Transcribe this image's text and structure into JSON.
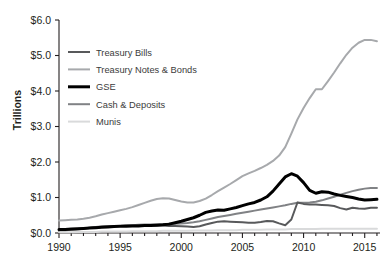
{
  "chart_data": {
    "type": "line",
    "title": "",
    "xlabel": "",
    "ylabel": "Trillions",
    "xlim": [
      1990,
      2016.25
    ],
    "ylim": [
      0.0,
      6.0
    ],
    "grid": false,
    "legend_position": "upper-left",
    "y_ticks": [
      0.0,
      1.0,
      2.0,
      3.0,
      4.0,
      5.0,
      6.0
    ],
    "y_tick_labels": [
      "$0.0",
      "$1.0",
      "$2.0",
      "$3.0",
      "$4.0",
      "$5.0",
      "$6.0"
    ],
    "x_ticks": [
      1990,
      1995,
      2000,
      2005,
      2010,
      2015
    ],
    "x_tick_labels": [
      "1990",
      "1995",
      "2000",
      "2005",
      "2010",
      "2015"
    ],
    "x_minor_tick_interval": 1,
    "x": [
      1990,
      1990.5,
      1991,
      1991.5,
      1992,
      1992.5,
      1993,
      1993.5,
      1994,
      1994.5,
      1995,
      1995.5,
      1996,
      1996.5,
      1997,
      1997.5,
      1998,
      1998.5,
      1999,
      1999.5,
      2000,
      2000.5,
      2001,
      2001.5,
      2002,
      2002.5,
      2003,
      2003.5,
      2004,
      2004.5,
      2005,
      2005.5,
      2006,
      2006.5,
      2007,
      2007.5,
      2008,
      2008.5,
      2009,
      2009.5,
      2010,
      2010.5,
      2011,
      2011.5,
      2012,
      2012.5,
      2013,
      2013.5,
      2014,
      2014.5,
      2015,
      2015.5,
      2016
    ],
    "series": [
      {
        "name": "Treasury Bills",
        "color": "#58595b",
        "width": 2.0,
        "values": [
          0.09,
          0.09,
          0.1,
          0.11,
          0.13,
          0.15,
          0.17,
          0.18,
          0.19,
          0.2,
          0.2,
          0.21,
          0.21,
          0.22,
          0.22,
          0.22,
          0.21,
          0.21,
          0.2,
          0.2,
          0.19,
          0.18,
          0.17,
          0.19,
          0.24,
          0.28,
          0.32,
          0.33,
          0.32,
          0.31,
          0.3,
          0.29,
          0.29,
          0.31,
          0.34,
          0.33,
          0.27,
          0.22,
          0.38,
          0.86,
          0.82,
          0.8,
          0.8,
          0.79,
          0.78,
          0.76,
          0.7,
          0.66,
          0.71,
          0.69,
          0.68,
          0.71,
          0.71
        ]
      },
      {
        "name": "Treasury Notes & Bonds",
        "color": "#a7a9ac",
        "width": 2.0,
        "values": [
          0.35,
          0.36,
          0.37,
          0.38,
          0.4,
          0.43,
          0.47,
          0.52,
          0.56,
          0.6,
          0.64,
          0.68,
          0.73,
          0.79,
          0.85,
          0.91,
          0.96,
          0.98,
          0.97,
          0.93,
          0.89,
          0.86,
          0.86,
          0.9,
          0.97,
          1.07,
          1.18,
          1.28,
          1.38,
          1.49,
          1.6,
          1.68,
          1.75,
          1.83,
          1.92,
          2.03,
          2.18,
          2.42,
          2.8,
          3.2,
          3.52,
          3.8,
          4.05,
          4.05,
          4.28,
          4.52,
          4.78,
          5.02,
          5.22,
          5.36,
          5.44,
          5.44,
          5.4
        ]
      },
      {
        "name": "GSE",
        "color": "#000000",
        "width": 3.0,
        "values": [
          0.1,
          0.1,
          0.11,
          0.12,
          0.13,
          0.14,
          0.15,
          0.16,
          0.17,
          0.18,
          0.19,
          0.19,
          0.2,
          0.2,
          0.21,
          0.21,
          0.22,
          0.23,
          0.25,
          0.29,
          0.33,
          0.38,
          0.43,
          0.5,
          0.58,
          0.62,
          0.65,
          0.64,
          0.68,
          0.72,
          0.77,
          0.82,
          0.86,
          0.93,
          1.02,
          1.18,
          1.38,
          1.58,
          1.67,
          1.6,
          1.42,
          1.2,
          1.12,
          1.16,
          1.15,
          1.1,
          1.06,
          1.03,
          1.0,
          0.96,
          0.93,
          0.94,
          0.95
        ]
      },
      {
        "name": "Cash & Deposits",
        "color": "#808285",
        "width": 2.0,
        "values": [
          0.08,
          0.08,
          0.09,
          0.1,
          0.12,
          0.14,
          0.16,
          0.17,
          0.18,
          0.19,
          0.2,
          0.21,
          0.22,
          0.23,
          0.24,
          0.24,
          0.25,
          0.25,
          0.26,
          0.26,
          0.27,
          0.28,
          0.3,
          0.33,
          0.37,
          0.41,
          0.45,
          0.48,
          0.51,
          0.54,
          0.57,
          0.6,
          0.63,
          0.66,
          0.69,
          0.72,
          0.75,
          0.78,
          0.82,
          0.85,
          0.85,
          0.86,
          0.88,
          0.92,
          0.97,
          1.02,
          1.08,
          1.13,
          1.18,
          1.22,
          1.25,
          1.27,
          1.27
        ]
      },
      {
        "name": "Munis",
        "color": "#d9dadb",
        "width": 2.0,
        "values": [
          0.02,
          0.02,
          0.02,
          0.03,
          0.03,
          0.03,
          0.03,
          0.04,
          0.04,
          0.04,
          0.04,
          0.04,
          0.05,
          0.05,
          0.05,
          0.05,
          0.05,
          0.06,
          0.06,
          0.06,
          0.06,
          0.06,
          0.07,
          0.07,
          0.07,
          0.07,
          0.08,
          0.08,
          0.08,
          0.08,
          0.09,
          0.09,
          0.09,
          0.09,
          0.1,
          0.1,
          0.1,
          0.1,
          0.11,
          0.11,
          0.11,
          0.11,
          0.11,
          0.12,
          0.12,
          0.12,
          0.12,
          0.12,
          0.12,
          0.12,
          0.12,
          0.12,
          0.12
        ]
      }
    ],
    "legend": [
      {
        "label": "Treasury Bills",
        "color": "#58595b",
        "width": 2.0
      },
      {
        "label": "Treasury Notes & Bonds",
        "color": "#a7a9ac",
        "width": 2.0
      },
      {
        "label": "GSE",
        "color": "#000000",
        "width": 3.0
      },
      {
        "label": "Cash & Deposits",
        "color": "#808285",
        "width": 2.0
      },
      {
        "label": "Munis",
        "color": "#d9dadb",
        "width": 2.0
      }
    ]
  }
}
